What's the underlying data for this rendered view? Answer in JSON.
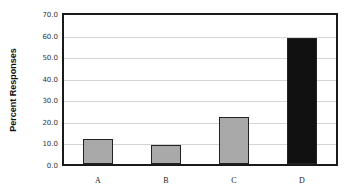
{
  "chart_data": {
    "type": "bar",
    "title": "",
    "xlabel": "",
    "ylabel": "Percent Responses",
    "categories": [
      "A",
      "B",
      "C",
      "D"
    ],
    "values": [
      11.5,
      9.0,
      22.0,
      58.5
    ],
    "bar_colors": [
      "#a9a9a9",
      "#a9a9a9",
      "#a9a9a9",
      "#111111"
    ],
    "ylim": [
      0,
      70
    ],
    "yticks": [
      "0.0",
      "10.0",
      "20.0",
      "30.0",
      "40.0",
      "50.0",
      "60.0",
      "70.0"
    ],
    "grid": true,
    "legend": null
  }
}
